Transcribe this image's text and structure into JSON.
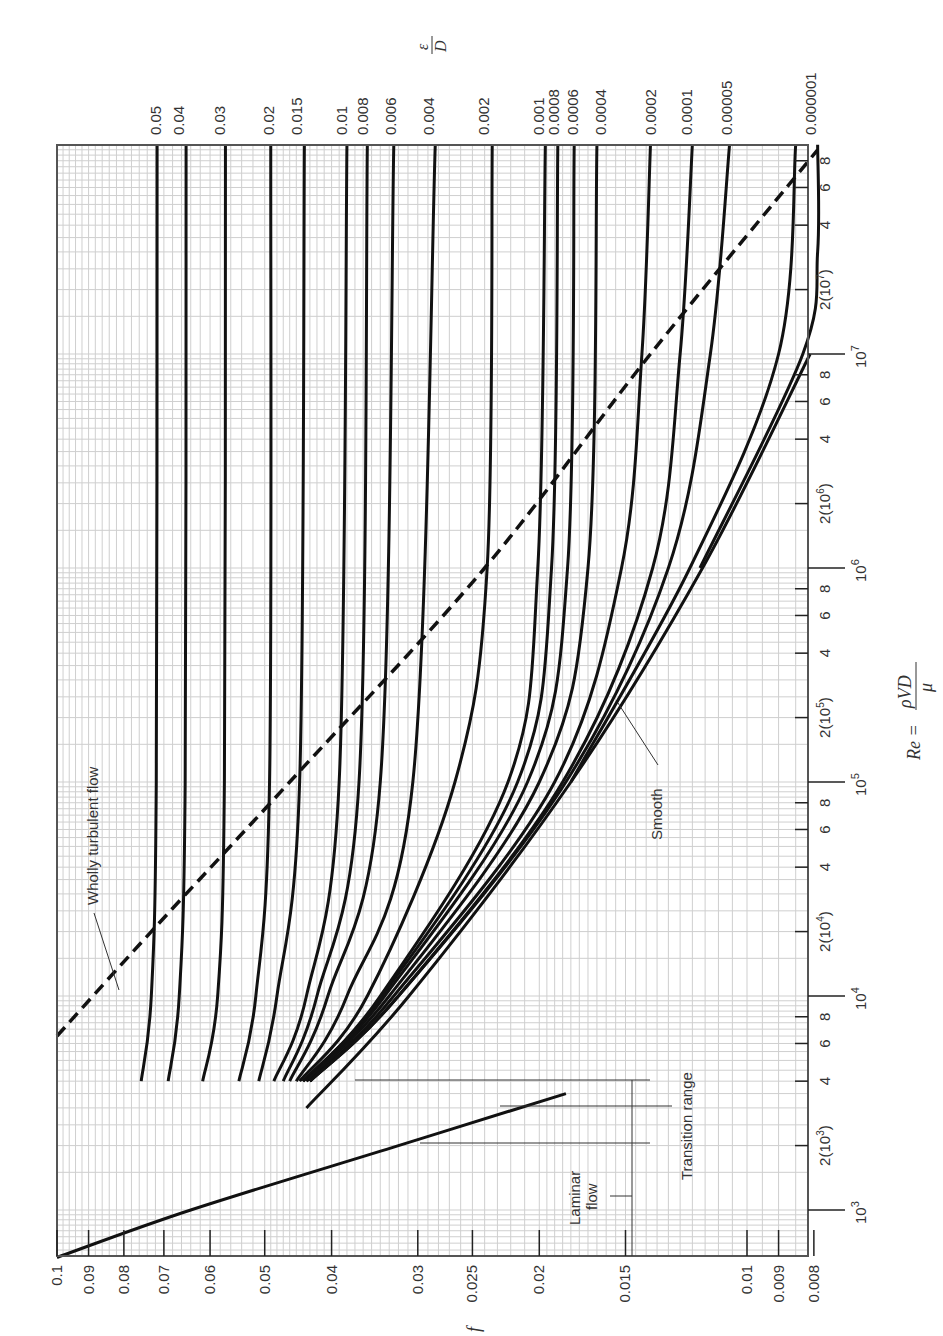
{
  "chart_data": {
    "type": "line",
    "orientation": "rotated 90° counter-clockwise",
    "xlabel": "Re = ρVD/μ",
    "ylabel": "f",
    "right_axis_label": "ε/D",
    "x_scale": "log",
    "y_scale": "log",
    "xlim": [
      600,
      100000000
    ],
    "ylim": [
      0.008,
      0.1
    ],
    "grid": true,
    "x_ticks": [
      "10^3",
      "2(10^3)",
      "4",
      "6",
      "8",
      "10^4",
      "2(10^4)",
      "4",
      "6",
      "8",
      "10^5",
      "2(10^5)",
      "4",
      "6",
      "8",
      "10^6",
      "2(10^6)",
      "4",
      "6",
      "8",
      "10^7",
      "2(10^7)",
      "4",
      "6",
      "8"
    ],
    "y_ticks": [
      "0.1",
      "0.09",
      "0.08",
      "0.07",
      "0.06",
      "0.05",
      "0.04",
      "0.03",
      "0.025",
      "0.02",
      "0.015",
      "0.01",
      "0.009",
      "0.008"
    ],
    "relative_roughness_labels": [
      "0.05",
      "0.04",
      "0.03",
      "0.02",
      "0.015",
      "0.01",
      "0.008",
      "0.006",
      "0.004",
      "0.002",
      "0.001",
      "0.0008",
      "0.0006",
      "0.0004",
      "0.0002",
      "0.0001",
      "0.00005",
      "0.00001",
      "0.000001"
    ],
    "series": [
      {
        "name": "Laminar flow",
        "formula": "f = 64/Re",
        "x": [
          600,
          1000,
          2000,
          3500
        ],
        "y": [
          0.1,
          0.064,
          0.032,
          0.0183
        ]
      },
      {
        "name": "Wholly turbulent flow boundary",
        "style": "dashed",
        "x": [
          6500,
          20000,
          100000,
          1000000,
          10000000,
          90000000
        ],
        "y": [
          0.1,
          0.073,
          0.046,
          0.024,
          0.0138,
          0.0078
        ]
      },
      {
        "name": "Smooth",
        "x": [
          3000,
          10000,
          100000,
          1000000,
          10000000
        ],
        "y": [
          0.0435,
          0.0309,
          0.018,
          0.0116,
          0.0081
        ]
      },
      {
        "name": "0.05",
        "x": [
          4000,
          10000,
          100000,
          100000000
        ],
        "y": [
          0.0755,
          0.073,
          0.0718,
          0.0716
        ]
      },
      {
        "name": "0.04",
        "x": [
          4000,
          10000,
          100000,
          100000000
        ],
        "y": [
          0.069,
          0.0665,
          0.0652,
          0.065
        ]
      },
      {
        "name": "0.03",
        "x": [
          4000,
          10000,
          100000,
          100000000
        ],
        "y": [
          0.0615,
          0.0585,
          0.0572,
          0.057
        ]
      },
      {
        "name": "0.02",
        "x": [
          4000,
          10000,
          100000,
          100000000
        ],
        "y": [
          0.0545,
          0.0515,
          0.0492,
          0.049
        ]
      },
      {
        "name": "0.015",
        "x": [
          4000,
          10000,
          100000,
          100000000
        ],
        "y": [
          0.051,
          0.048,
          0.0445,
          0.0438
        ]
      },
      {
        "name": "0.01",
        "x": [
          4000,
          10000,
          100000,
          100000000
        ],
        "y": [
          0.0485,
          0.0435,
          0.039,
          0.038
        ]
      },
      {
        "name": "0.008",
        "x": [
          4000,
          10000,
          100000,
          100000000
        ],
        "y": [
          0.047,
          0.042,
          0.0365,
          0.0355
        ]
      },
      {
        "name": "0.006",
        "x": [
          4000,
          10000,
          100000,
          100000000
        ],
        "y": [
          0.046,
          0.0405,
          0.034,
          0.0325
        ]
      },
      {
        "name": "0.004",
        "x": [
          4000,
          10000,
          100000,
          100000000
        ],
        "y": [
          0.045,
          0.038,
          0.0305,
          0.0283
        ]
      },
      {
        "name": "0.002",
        "x": [
          4000,
          10000,
          100000,
          1000000,
          100000000
        ],
        "y": [
          0.0445,
          0.0355,
          0.0265,
          0.0238,
          0.0234
        ]
      },
      {
        "name": "0.001",
        "x": [
          4000,
          10000,
          100000,
          1000000,
          100000000
        ],
        "y": [
          0.044,
          0.034,
          0.0222,
          0.0201,
          0.0196
        ]
      },
      {
        "name": "0.0008",
        "x": [
          4000,
          10000,
          100000,
          1000000,
          100000000
        ],
        "y": [
          0.044,
          0.0338,
          0.0215,
          0.0192,
          0.0188
        ]
      },
      {
        "name": "0.0006",
        "x": [
          4000,
          10000,
          100000,
          1000000,
          100000000
        ],
        "y": [
          0.0435,
          0.0335,
          0.0208,
          0.0182,
          0.0178
        ]
      },
      {
        "name": "0.0004",
        "x": [
          4000,
          10000,
          100000,
          1000000,
          100000000
        ],
        "y": [
          0.0435,
          0.033,
          0.02,
          0.017,
          0.0165
        ]
      },
      {
        "name": "0.0002",
        "x": [
          4000,
          10000,
          100000,
          1000000,
          10000000,
          100000000
        ],
        "y": [
          0.043,
          0.0325,
          0.019,
          0.0152,
          0.0142,
          0.0138
        ]
      },
      {
        "name": "0.0001",
        "x": [
          4000,
          10000,
          100000,
          1000000,
          10000000,
          100000000
        ],
        "y": [
          0.043,
          0.032,
          0.0185,
          0.0137,
          0.0125,
          0.012
        ]
      },
      {
        "name": "0.00005",
        "x": [
          4000,
          10000,
          100000,
          1000000,
          10000000,
          100000000
        ],
        "y": [
          0.043,
          0.032,
          0.0183,
          0.013,
          0.0113,
          0.0106
        ]
      },
      {
        "name": "0.00001",
        "x": [
          100000,
          1000000,
          10000000,
          100000000
        ],
        "y": [
          0.018,
          0.0121,
          0.009,
          0.0085
        ]
      },
      {
        "name": "0.000001",
        "x": [
          1000000,
          10000000,
          30000000,
          100000000
        ],
        "y": [
          0.0117,
          0.0083,
          0.0078,
          0.0078
        ]
      }
    ],
    "annotations": [
      "Wholly turbulent flow",
      "Transition range",
      "Laminar flow",
      "Smooth"
    ]
  },
  "labels": {
    "f_axis": "f",
    "re_axis_prefix": "Re = ",
    "re_axis_num": "ρVD",
    "re_axis_den": "μ",
    "ed_num": "ε",
    "ed_den": "D",
    "wholly_turbulent": "Wholly turbulent flow",
    "transition": "Transition range",
    "laminar_1": "Laminar",
    "laminar_2": "flow",
    "smooth": "Smooth"
  }
}
